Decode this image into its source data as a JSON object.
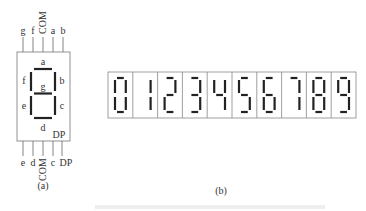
{
  "panel_a": {
    "caption": "(a)",
    "top_pins": [
      "g",
      "f",
      "COM",
      "a",
      "b"
    ],
    "bottom_pins": [
      "e",
      "d",
      "COM",
      "c",
      "DP"
    ],
    "segment_labels": {
      "a": "a",
      "b": "b",
      "c": "c",
      "d": "d",
      "e": "e",
      "f": "f",
      "g": "g",
      "dp": "DP"
    }
  },
  "panel_b": {
    "caption": "(b)",
    "digits": [
      "0",
      "1",
      "2",
      "3",
      "4",
      "5",
      "6",
      "7",
      "8",
      "9"
    ]
  },
  "colors": {
    "stroke": "#555555",
    "segment": "#222222"
  }
}
